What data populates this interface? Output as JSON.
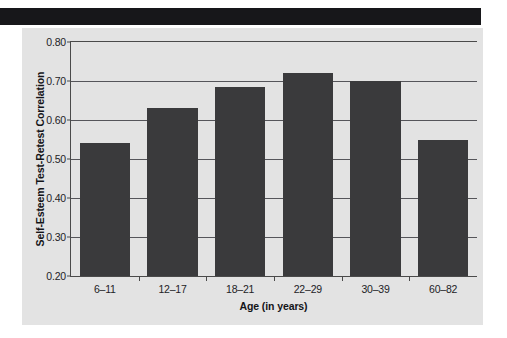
{
  "figure": {
    "panel_background": "#e3e3e3",
    "banner_color": "#17171a",
    "bar_color": "#3a3a3c",
    "axis_color": "#4a4a4a"
  },
  "chart_data": {
    "type": "bar",
    "title": "",
    "xlabel": "Age (in years)",
    "ylabel": "Self-Esteem Test-Retest Correlation",
    "categories": [
      "6–11",
      "12–17",
      "18–21",
      "22–29",
      "30–39",
      "60–82"
    ],
    "values": [
      0.54,
      0.63,
      0.685,
      0.72,
      0.7,
      0.55
    ],
    "ylim": [
      0.2,
      0.8
    ],
    "yticks": [
      0.2,
      0.3,
      0.4,
      0.5,
      0.6,
      0.7,
      0.8
    ],
    "ytick_labels": [
      "0.20",
      "0.30",
      "0.40",
      "0.50",
      "0.60",
      "0.70",
      "0.80"
    ],
    "grid": true,
    "legend": null,
    "series": [
      {
        "name": "Self-Esteem Test-Retest Correlation",
        "values": [
          0.54,
          0.63,
          0.685,
          0.72,
          0.7,
          0.55
        ]
      }
    ]
  }
}
